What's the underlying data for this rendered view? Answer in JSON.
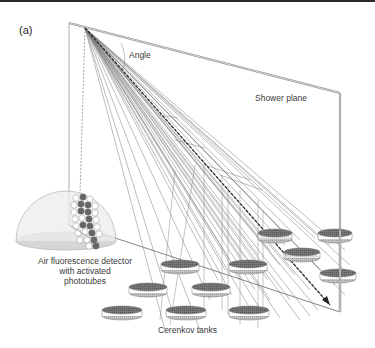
{
  "figure": {
    "panel_label": "(a)",
    "labels": {
      "angle": "Angle",
      "shower_plane": "Shower plane",
      "detector_line1": "Air fluorescence detector",
      "detector_line2": "with activated",
      "detector_line3": "phototubes",
      "tanks": "Cerenkov tanks"
    },
    "colors": {
      "plane_edge": "#8a8a8a",
      "shower_lines": "#7a7a7a",
      "tank_top": "#6e6e6e",
      "tank_bottom": "#bdbdbd",
      "dome_fill": "#e6e6e6",
      "phototube_active": "#6a6a6a",
      "phototube_inactive": "#ffffff"
    },
    "tanks": [
      {
        "cx": 180,
        "cy": 264
      },
      {
        "cx": 248,
        "cy": 264
      },
      {
        "cx": 150,
        "cy": 287
      },
      {
        "cx": 211,
        "cy": 287
      },
      {
        "cx": 122,
        "cy": 310
      },
      {
        "cx": 186,
        "cy": 310
      },
      {
        "cx": 249,
        "cy": 310
      },
      {
        "cx": 280,
        "cy": 233
      },
      {
        "cx": 302,
        "cy": 253
      },
      {
        "cx": 336,
        "cy": 233
      },
      {
        "cx": 339,
        "cy": 274
      }
    ]
  }
}
